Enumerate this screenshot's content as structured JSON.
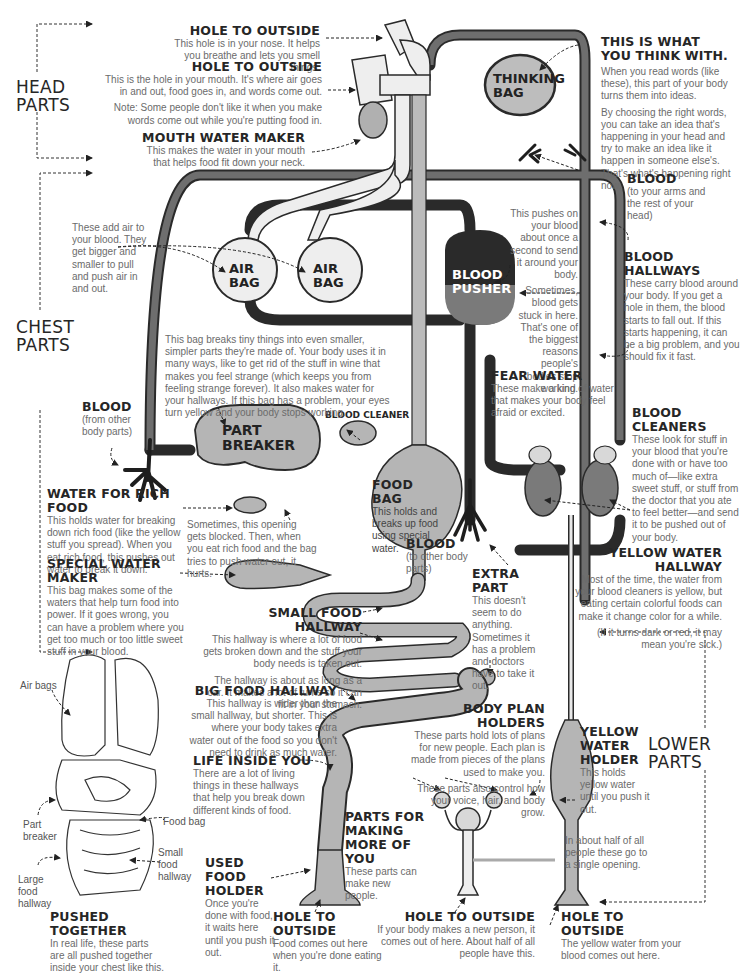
{
  "sections": {
    "head": "HEAD\nPARTS",
    "chest": "CHEST\nPARTS",
    "lower": "LOWER\nPARTS"
  },
  "organ_labels": {
    "thinking_bag": "THINKING\nBAG",
    "air_bag_left": "AIR\nBAG",
    "air_bag_right": "AIR\nBAG",
    "blood_pusher": "BLOOD\nPUSHER",
    "part_breaker": "PART\nBREAKER",
    "blood_cleaner_title": "BLOOD CLEANER"
  },
  "callouts": {
    "nose_hole": {
      "title": "HOLE TO OUTSIDE",
      "text": "This hole is in your nose. It helps you breathe and lets you smell things."
    },
    "mouth_hole": {
      "title": "HOLE TO OUTSIDE",
      "text": "This is the hole in your mouth. It's where air goes in and out, food goes in, and words come out.",
      "note": "Note: Some people don't like it when you make words come out while you're putting food in."
    },
    "mouth_water_maker": {
      "title": "MOUTH WATER MAKER",
      "text": "This makes the water in your mouth that helps food fit down your neck."
    },
    "think_with": {
      "title": "THIS IS WHAT YOU THINK WITH.",
      "text": "When you read words (like these), this part of your body turns them into ideas.",
      "text2": "By choosing the right words, you can take an idea that's happening in your head and try to make an idea like it happen in someone else's. That's what's happening right now."
    },
    "blood_top": {
      "title": "BLOOD",
      "text": "(to your arms and the rest of your head)"
    },
    "air_bags": {
      "text": "These add air to your blood. They get bigger and smaller to pull and push air in and out."
    },
    "blood_pusher": {
      "text": "This pushes on your blood about once a second to send it around your body.",
      "text2": "Sometimes, blood gets stuck in here. That's one of the biggest reasons people's bodies stop working."
    },
    "blood_hallways": {
      "title": "BLOOD HALLWAYS",
      "text": "These carry blood around your body. If you get a hole in them, the blood starts to fall out. If this starts happening, it can be a big problem, and you should fix it fast."
    },
    "part_breaker": {
      "text": "This bag breaks tiny things into even smaller, simpler parts they're made of. Your body uses it in many ways, like to get rid of the stuff in wine that makes you feel strange (which keeps you from feeling strange forever). It also makes water for your hallways. If this bag has a problem, your eyes turn yellow and your body stops working."
    },
    "blood_left": {
      "title": "BLOOD",
      "text": "(from other body parts)"
    },
    "fear_water": {
      "title": "FEAR WATER",
      "text": "These make a kind of water that makes your body feel afraid or excited."
    },
    "blood_cleaners": {
      "title": "BLOOD CLEANERS",
      "text": "These look for stuff in your blood that you're done with or have too much of—like extra sweet stuff, or stuff from the doctor that you ate to feel better—and send it to be pushed out of your body."
    },
    "food_bag": {
      "title": "FOOD BAG",
      "text": "This holds and breaks up food using special water."
    },
    "blood_mid": {
      "title": "BLOOD",
      "text": "(to other body parts)"
    },
    "water_rich_food": {
      "title": "WATER FOR RICH FOOD",
      "text": "This holds water for breaking down rich food (like the yellow stuff you spread). When you eat rich food, this pushes out water to break it down."
    },
    "opening_blocked": {
      "text": "Sometimes, this opening gets blocked. Then, when you eat rich food and the bag tries to push water out, it hurts."
    },
    "special_water_maker": {
      "title": "SPECIAL WATER MAKER",
      "text": "This bag makes some of the waters that help turn food into power. If it goes wrong, you can have a problem where you get too much or too little sweet stuff in your blood."
    },
    "yellow_water_hallway": {
      "title": "YELLOW WATER HALLWAY",
      "text": "Most of the time, the water from your blood cleaners is yellow, but eating certain colorful foods can make it change color for a while.",
      "text2": "(If it turns dark or red, it may mean you're sick.)"
    },
    "extra_part": {
      "title": "EXTRA PART",
      "text": "This doesn't seem to do anything. Sometimes it has a problem and doctors have to take it out."
    },
    "small_food_hallway": {
      "title": "SMALL FOOD HALLWAY",
      "text": "This hallway is where a lot of food gets broken down and the stuff your body needs is taken out.",
      "text2": "The hallway is about as long as a car. It makes a lot of turns so it can fit in your stomach."
    },
    "big_food_hallway": {
      "title": "BIG FOOD HALLWAY",
      "text": "This hallway is wider than the small hallway, but shorter. This is where your body takes extra water out of the food so you don't need to drink as much water."
    },
    "body_plan_holders": {
      "title": "BODY PLAN HOLDERS",
      "text": "These parts hold lots of plans for new people. Each plan is made from pieces of the plans used to make you.",
      "text2": "These parts also control how your voice, hair, and body grow."
    },
    "yellow_water_holder": {
      "title": "YELLOW WATER HOLDER",
      "text": "This holds yellow water until you push it out."
    },
    "life_inside": {
      "title": "LIFE INSIDE YOU",
      "text": "There are a lot of living things in these hallways that help you break down different kinds of food."
    },
    "making_more": {
      "title": "PARTS FOR MAKING MORE OF YOU",
      "text": "These parts can make new people."
    },
    "single_opening": {
      "text": "In about half of all people these go to a single opening."
    },
    "used_food_holder": {
      "title": "USED FOOD HOLDER",
      "text": "Once you're done with food, it waits here until you push it out."
    },
    "hole_food": {
      "title": "HOLE TO OUTSIDE",
      "text": "Food comes out here when you're done eating it."
    },
    "hole_baby": {
      "title": "HOLE TO OUTSIDE",
      "text": "If your body makes a new person, it comes out of here. About half of all people have this."
    },
    "hole_yellow": {
      "title": "HOLE TO OUTSIDE",
      "text": "The yellow water from your blood comes out here."
    },
    "pushed_together": {
      "title": "PUSHED TOGETHER",
      "text": "In real life, these parts are all pushed together inside your chest like this."
    }
  },
  "inset_labels": {
    "air_bags": "Air bags",
    "part_breaker": "Part\nbreaker",
    "food_bag": "Food bag",
    "small_food_hallway": "Small\nfood\nhallway",
    "large_food_hallway": "Large\nfood\nhallway"
  },
  "colors": {
    "blood_dark": "#3a3a3a",
    "organ_gray": "#b5b5b5",
    "pale": "#e6e6e6",
    "outline": "#2a2a2a",
    "text_gray": "#6b6b6b"
  }
}
